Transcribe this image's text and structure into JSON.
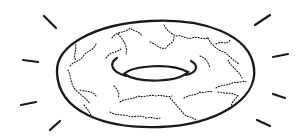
{
  "image": {
    "subject": "donut",
    "description": "Black-and-white line drawing of a sprinkled/glazed donut with radiating shine lines",
    "colors": {
      "background": "#ffffff",
      "ink": "#1a1a1a"
    }
  },
  "shine_lines": [
    {
      "x1": 44,
      "y1": 16,
      "x2": 56,
      "y2": 28
    },
    {
      "x1": 23,
      "y1": 60,
      "x2": 38,
      "y2": 62
    },
    {
      "x1": 21,
      "y1": 105,
      "x2": 36,
      "y2": 102
    },
    {
      "x1": 50,
      "y1": 130,
      "x2": 60,
      "y2": 121
    },
    {
      "x1": 255,
      "y1": 25,
      "x2": 270,
      "y2": 15
    },
    {
      "x1": 273,
      "y1": 57,
      "x2": 288,
      "y2": 54
    },
    {
      "x1": 273,
      "y1": 94,
      "x2": 285,
      "y2": 98
    },
    {
      "x1": 257,
      "y1": 120,
      "x2": 270,
      "y2": 126
    }
  ]
}
